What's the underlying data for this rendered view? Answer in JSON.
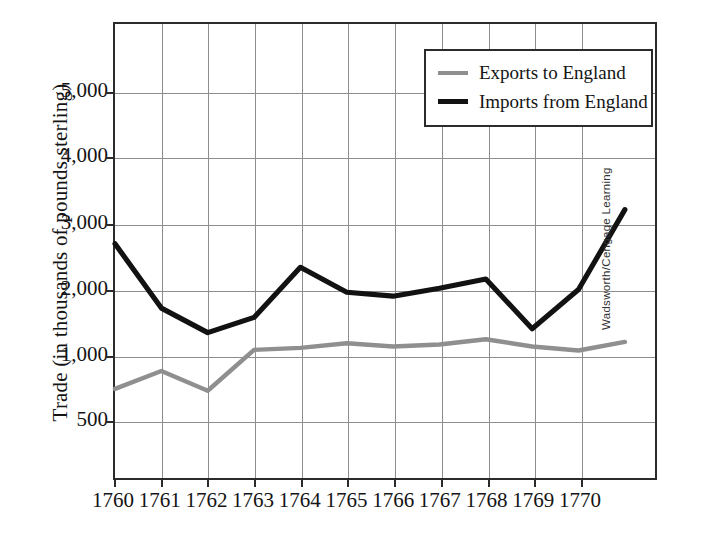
{
  "chart_data": {
    "type": "line",
    "title": "",
    "subtitle": "",
    "xlabel": "",
    "ylabel": "Trade (in thousands of pounds sterling)",
    "categories": [
      "1760",
      "1761",
      "1762",
      "1763",
      "1764",
      "1765",
      "1766",
      "1767",
      "1768",
      "1769",
      "1770",
      ""
    ],
    "x_tick_labels": [
      "1760",
      "1761",
      "1762",
      "1763",
      "1764",
      "1765",
      "1766",
      "1767",
      "1768",
      "1769",
      "1770"
    ],
    "y_tick_labels": [
      "5,000",
      "4,000",
      "3,000",
      "2,000",
      "1,000",
      "500"
    ],
    "y_tick_values": [
      5000,
      4000,
      3000,
      2000,
      1000,
      500
    ],
    "y_tick_pixel_fractions": [
      0.15,
      0.292,
      0.438,
      0.582,
      0.728,
      0.868
    ],
    "ylim": [
      0,
      5800
    ],
    "grid": "both",
    "legend_position": "top-right",
    "series": [
      {
        "name": "Exports to England",
        "color": "#8f8f8f",
        "values": [
          730,
          870,
          715,
          1070,
          1100,
          1170,
          1120,
          1150,
          1230,
          1120,
          1060,
          1190
        ]
      },
      {
        "name": "Imports from England",
        "color": "#121212",
        "values": [
          2680,
          1700,
          1330,
          1560,
          2320,
          1940,
          1880,
          2000,
          2140,
          1390,
          1980,
          3200
        ]
      }
    ],
    "annotations": []
  },
  "legend": {
    "items": [
      {
        "label": "Exports to England",
        "color": "#8f8f8f",
        "weight": "thin"
      },
      {
        "label": "Imports from England",
        "color": "#121212",
        "weight": "thick"
      }
    ]
  },
  "credit": {
    "text": "Wadsworth/Cengage Learning"
  },
  "colors": {
    "exports": "#8f8f8f",
    "imports": "#121212",
    "axis": "#2b2b2b",
    "grid": "#8d8d8d",
    "background": "#ffffff",
    "text": "#141414"
  }
}
